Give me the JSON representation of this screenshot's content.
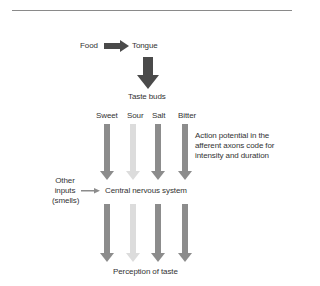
{
  "diagram": {
    "top_flow": {
      "food": "Food",
      "tongue": "Tongue",
      "taste_buds": "Taste buds"
    },
    "tastes": [
      {
        "label": "Sweet",
        "color": "#8c8c8c"
      },
      {
        "label": "Sour",
        "color": "#dcdcdc"
      },
      {
        "label": "Salt",
        "color": "#8c8c8c"
      },
      {
        "label": "Bitter",
        "color": "#8c8c8c"
      }
    ],
    "annotation": {
      "line1": "Action potential in the",
      "line2": "afferent axons code for",
      "line3": "intensity and duration"
    },
    "other_inputs": {
      "line1": "Other",
      "line2": "inputs",
      "line3": "(smells)"
    },
    "cns": "Central nervous system",
    "perception": "Perception of taste",
    "colors": {
      "dark_arrow": "#4a4a4a",
      "mid_arrow": "#8c8c8c",
      "light_arrow": "#dcdcdc",
      "text": "#333333",
      "rule": "#8a8a8a"
    }
  }
}
